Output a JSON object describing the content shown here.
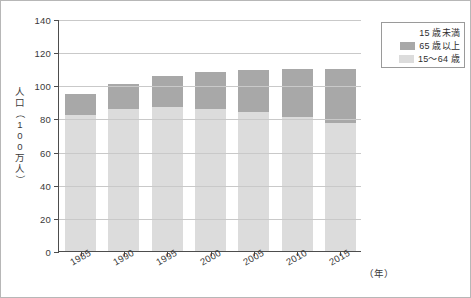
{
  "chart_data": {
    "type": "bar",
    "stacked": true,
    "title": "",
    "xlabel": "（年）",
    "ylabel": "人口（100万人）",
    "categories": [
      "1985",
      "1990",
      "1995",
      "2000",
      "2005",
      "2010",
      "2015"
    ],
    "series": [
      {
        "name": "15～64 歳",
        "color": "#dcdcdc",
        "values": [
          82,
          86,
          87,
          86,
          84,
          81,
          77
        ]
      },
      {
        "name": "65 歳以上",
        "color": "#a8a8a8",
        "values": [
          13,
          14.5,
          18.5,
          22,
          25.5,
          29,
          33
        ]
      },
      {
        "name": "15 歳未満",
        "color": "#ffffff",
        "values": [
          0,
          0,
          0,
          0,
          0,
          0,
          0
        ]
      }
    ],
    "totals": [
      95,
      100.5,
      105.5,
      108,
      109.5,
      110,
      110
    ],
    "ylim": [
      0,
      140
    ],
    "yticks": [
      0,
      20,
      40,
      60,
      80,
      100,
      120,
      140
    ],
    "ytick_labels": [
      "0",
      "20",
      "40",
      "60",
      "80",
      "100",
      "120",
      "140"
    ],
    "grid": true,
    "legend_position": "top-right"
  },
  "axis": {
    "y_title_chars": [
      "人",
      "口",
      "（",
      "1",
      "0",
      "0",
      "万",
      "人",
      "）"
    ],
    "x_unit": "（年）"
  },
  "legend": {
    "entries": [
      {
        "label": "15 歳未満",
        "swatch": "child"
      },
      {
        "label": "65 歳以上",
        "swatch": "senior"
      },
      {
        "label": "15～64 歳",
        "swatch": "working"
      }
    ]
  }
}
